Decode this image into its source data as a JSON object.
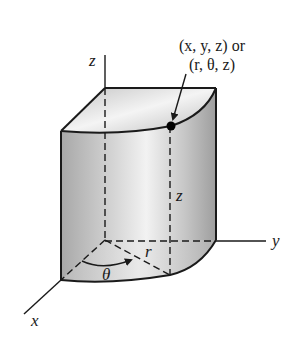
{
  "diagram": {
    "type": "cylindrical-coordinates-figure",
    "point_label_line1": "(x, y, z) or",
    "point_label_line2": "(r, θ, z)",
    "axes": {
      "x": "x",
      "y": "y",
      "z": "z"
    },
    "dimension_labels": {
      "height": "z",
      "radius": "r",
      "angle": "θ"
    },
    "colors": {
      "line": "#1a1a1a",
      "solid_fill_light": "#ececec",
      "solid_fill_mid": "#cfcfcf",
      "solid_fill_dark": "#a9a9a9",
      "point": "#000000"
    }
  }
}
